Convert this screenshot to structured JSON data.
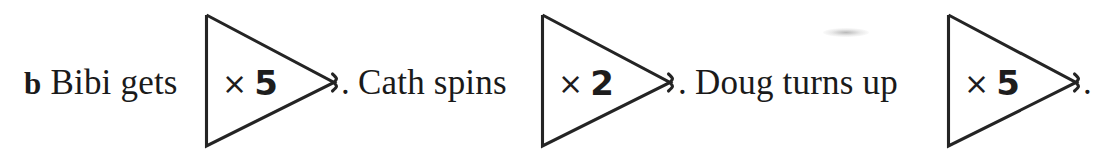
{
  "page": {
    "background": "#ffffff",
    "ink_color": "#242424",
    "width": 1099,
    "height": 157
  },
  "question": {
    "part_label": "b",
    "terminator": ".",
    "multiply_sign": "×"
  },
  "items": [
    {
      "id": "bibi",
      "prompt": "Bibi gets",
      "has_part_label": true,
      "part_label": "b",
      "operator": "×",
      "value": "5",
      "machine_text": "× 5",
      "terminator": ".",
      "text_x": 24,
      "text_baseline_y": 96,
      "triangle": {
        "left": 205,
        "top": 15,
        "bottom": 146,
        "apex_x": 337,
        "apex_y": 85
      },
      "value_x": 222,
      "value_baseline_y": 96,
      "period_x": 341
    },
    {
      "id": "cath",
      "prompt": "Cath spins",
      "has_part_label": false,
      "part_label": "",
      "operator": "×",
      "value": "2",
      "machine_text": "× 2",
      "terminator": ".",
      "text_x": 358,
      "text_baseline_y": 96,
      "triangle": {
        "left": 541,
        "top": 15,
        "bottom": 146,
        "apex_x": 673,
        "apex_y": 85
      },
      "value_x": 558,
      "value_baseline_y": 96,
      "period_x": 678
    },
    {
      "id": "doug",
      "prompt": "Doug turns up",
      "has_part_label": false,
      "part_label": "",
      "operator": "×",
      "value": "5",
      "machine_text": "× 5",
      "terminator": ".",
      "text_x": 695,
      "text_baseline_y": 96,
      "triangle": {
        "left": 947,
        "top": 15,
        "bottom": 146,
        "apex_x": 1078,
        "apex_y": 85
      },
      "value_x": 964,
      "value_baseline_y": 96,
      "period_x": 1083
    }
  ],
  "artifacts": {
    "smudge": {
      "x": 823,
      "y": 28,
      "width": 46,
      "height": 9
    }
  }
}
